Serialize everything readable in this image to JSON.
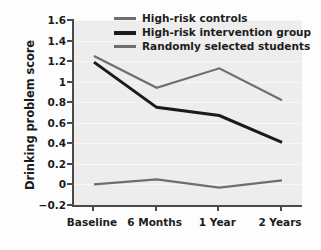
{
  "chart_data": {
    "type": "line",
    "title": "",
    "xlabel": "",
    "ylabel": "Drinking problem score",
    "categories": [
      "Baseline",
      "6 Months",
      "1 Year",
      "2 Years"
    ],
    "ylim": [
      -0.2,
      1.6
    ],
    "yticks": [
      "1.6",
      "1.4",
      "1.2",
      "1",
      "0.8",
      "0.6",
      "0.4",
      "0.2",
      "0",
      "-0.2"
    ],
    "ytick_values": [
      1.6,
      1.4,
      1.2,
      1,
      0.8,
      0.6,
      0.4,
      0.2,
      0,
      -0.2
    ],
    "grid": true,
    "legend_position": "top-center",
    "series": [
      {
        "name": "High-risk controls",
        "values": [
          1.25,
          0.94,
          1.13,
          0.82
        ],
        "color": "#6e6e6e",
        "width": 2.2
      },
      {
        "name": "High-risk intervention group",
        "values": [
          1.19,
          0.75,
          0.67,
          0.41
        ],
        "color": "#1a1a1a",
        "width": 3.0
      },
      {
        "name": "Randomly selected students",
        "values": [
          0.0,
          0.05,
          -0.03,
          0.04
        ],
        "color": "#6e6e6e",
        "width": 2.2
      }
    ]
  },
  "legend": {
    "items": [
      {
        "label": "High-risk controls",
        "color": "#6e6e6e",
        "thick": false
      },
      {
        "label": "High-risk intervention group",
        "color": "#1a1a1a",
        "thick": true
      },
      {
        "label": "Randomly selected students",
        "color": "#6e6e6e",
        "thick": false
      }
    ]
  },
  "colors": {
    "plot_background": "#ededed",
    "gridline": "#f7f7f7",
    "axis": "#4a4a4a",
    "text": "#1c1c1c",
    "page_background": "#fdfdfd"
  }
}
